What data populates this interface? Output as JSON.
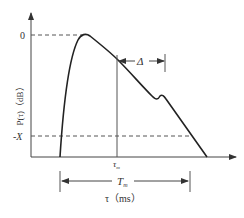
{
  "diagram": {
    "type": "power-delay-profile",
    "y_axis": {
      "label": "P(τ)（dB）",
      "ticks": [
        {
          "label": "0",
          "y": 35
        },
        {
          "label": "-X",
          "y": 136
        }
      ]
    },
    "x_axis": {
      "label": "τ（ms）",
      "marker": "τ",
      "marker_sub": "m"
    },
    "annotations": {
      "delta": "Δ",
      "span": "T",
      "span_sub": "m"
    },
    "colors": {
      "line": "#222222",
      "axis": "#444444",
      "dashed": "#555555",
      "text": "#333333"
    }
  }
}
